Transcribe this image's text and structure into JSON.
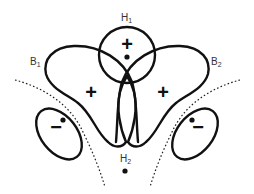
{
  "diagram": {
    "labels": {
      "h1": {
        "main": "H",
        "sub": "1"
      },
      "h2": {
        "main": "H",
        "sub": "2"
      },
      "b1": {
        "main": "B",
        "sub": "1"
      },
      "b2": {
        "main": "B",
        "sub": "2"
      }
    },
    "signs": {
      "h1_orbital": "+",
      "b1_lobe": "+",
      "b2_lobe": "+",
      "left_small_lobe": "−",
      "right_small_lobe": "−"
    },
    "colors": {
      "stroke": "#111111",
      "text": "#333333",
      "background": "#ffffff"
    }
  }
}
